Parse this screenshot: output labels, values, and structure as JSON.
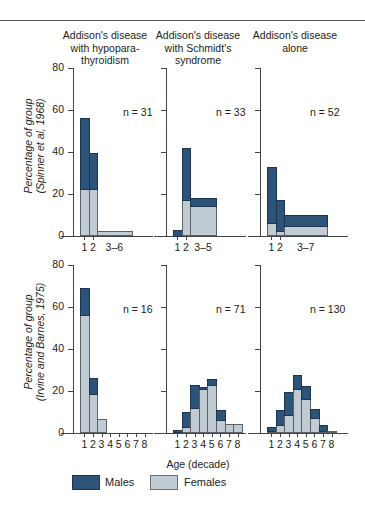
{
  "chart_data": {
    "type": "bar",
    "stacked": true,
    "column_titles": [
      "Addison's disease with hypopara-thyroidism",
      "Addison's disease with Schmidt's syndrome",
      "Addison's disease alone"
    ],
    "row_ylabels": [
      [
        "Percentage of group",
        "(Spinner et al, 1968)"
      ],
      [
        "Percentage of group",
        "(Irvine and Barnes, 1975)"
      ]
    ],
    "xlabel": "Age (decade)",
    "ylim": [
      0,
      80
    ],
    "yticks": [
      0,
      20,
      40,
      60,
      80
    ],
    "legend": [
      {
        "name": "Males",
        "color": "#2c5478"
      },
      {
        "name": "Females",
        "color": "#c0cbd3"
      }
    ],
    "panels": [
      {
        "row": 0,
        "col": 0,
        "n": "n = 31",
        "categories": [
          "1",
          "2",
          "3–6"
        ],
        "widths": [
          1,
          1,
          4
        ],
        "series": [
          {
            "name": "Females",
            "values": [
              22.5,
              22.5,
              2
            ]
          },
          {
            "name": "Males",
            "values": [
              33.5,
              17,
              0
            ]
          }
        ]
      },
      {
        "row": 0,
        "col": 1,
        "n": "n = 33",
        "categories": [
          "1",
          "2",
          "3–5"
        ],
        "widths": [
          1,
          1,
          3
        ],
        "series": [
          {
            "name": "Females",
            "values": [
              0,
              17,
              14.5
            ]
          },
          {
            "name": "Males",
            "values": [
              3,
              25,
              3.5
            ]
          }
        ]
      },
      {
        "row": 0,
        "col": 2,
        "n": "n = 52",
        "categories": [
          "1",
          "2",
          "3–7"
        ],
        "widths": [
          1,
          1,
          5
        ],
        "series": [
          {
            "name": "Females",
            "values": [
              6,
              2.5,
              5
            ]
          },
          {
            "name": "Males",
            "values": [
              27,
              14.5,
              5
            ]
          }
        ]
      },
      {
        "row": 1,
        "col": 0,
        "n": "n = 16",
        "categories": [
          "1",
          "2",
          "3",
          "4",
          "5",
          "6",
          "7",
          "8"
        ],
        "widths": [
          1,
          1,
          1,
          1,
          1,
          1,
          1,
          1
        ],
        "series": [
          {
            "name": "Females",
            "values": [
              56,
              18.5,
              6,
              0,
              0,
              0,
              0,
              0
            ]
          },
          {
            "name": "Males",
            "values": [
              13,
              7.5,
              0,
              0,
              0,
              0,
              0,
              0
            ]
          }
        ]
      },
      {
        "row": 1,
        "col": 1,
        "n": "n = 71",
        "categories": [
          "1",
          "2",
          "3",
          "4",
          "5",
          "6",
          "7",
          "8"
        ],
        "widths": [
          1,
          1,
          1,
          1,
          1,
          1,
          1,
          1
        ],
        "series": [
          {
            "name": "Females",
            "values": [
              0.5,
              3,
              12,
              21,
              23,
              6,
              4,
              4
            ]
          },
          {
            "name": "Males",
            "values": [
              1,
              7,
              11,
              1,
              2.5,
              5,
              0,
              0
            ]
          }
        ]
      },
      {
        "row": 1,
        "col": 2,
        "n": "n = 130",
        "categories": [
          "1",
          "2",
          "3",
          "4",
          "5",
          "6",
          "7",
          "8"
        ],
        "widths": [
          1,
          1,
          1,
          1,
          1,
          1,
          1,
          1
        ],
        "series": [
          {
            "name": "Females",
            "values": [
              1,
              4,
              8.5,
              21,
              16,
              7,
              1,
              0.5
            ]
          },
          {
            "name": "Males",
            "values": [
              2,
              7,
              11,
              6.5,
              6.5,
              4.5,
              3,
              0
            ]
          }
        ]
      }
    ]
  }
}
